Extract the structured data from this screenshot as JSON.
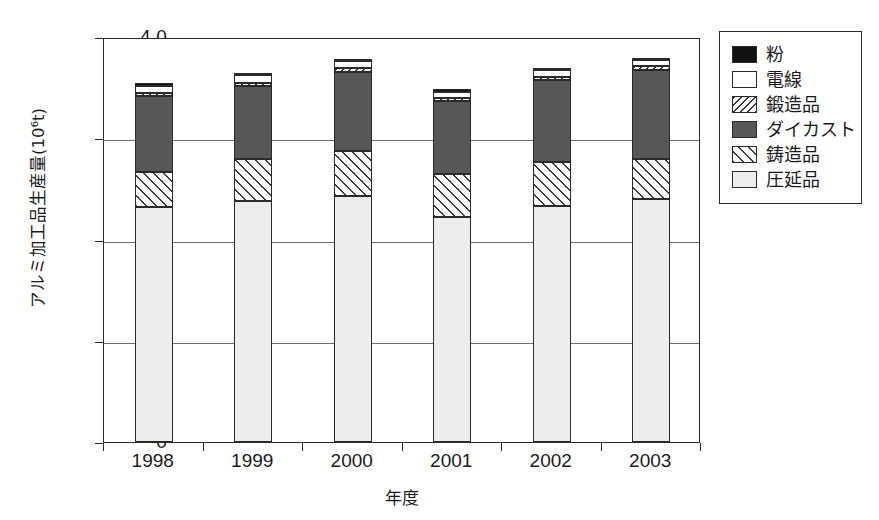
{
  "chart_data": {
    "type": "bar",
    "subtype": "stacked-vertical",
    "title": "",
    "xlabel": "年度",
    "ylabel": "アルミ加工品生産量(10⁶t)",
    "categories": [
      "1998",
      "1999",
      "2000",
      "2001",
      "2002",
      "2003"
    ],
    "ylim": [
      0,
      4.0
    ],
    "ytick_labels": [
      "0",
      "1.0",
      "2.0",
      "3.0",
      "4.0"
    ],
    "ytick_values": [
      0,
      1.0,
      2.0,
      3.0,
      4.0
    ],
    "grid": "horizontal",
    "legend_position": "right-outside",
    "legend_order_top_to_bottom": [
      "粉",
      "電線",
      "鍛造品",
      "ダイカスト",
      "鋳造品",
      "圧延品"
    ],
    "stack_order_bottom_to_top": [
      "圧延品",
      "鋳造品",
      "ダイカスト",
      "鍛造品",
      "電線",
      "粉"
    ],
    "series": [
      {
        "name": "圧延品",
        "pattern": "light-gray-solid",
        "color": "#ededed",
        "values": [
          2.32,
          2.38,
          2.43,
          2.22,
          2.33,
          2.4
        ]
      },
      {
        "name": "鋳造品",
        "pattern": "forward-hatch",
        "color": "#ffffff",
        "values": [
          0.35,
          0.42,
          0.44,
          0.43,
          0.44,
          0.4
        ]
      },
      {
        "name": "ダイカスト",
        "pattern": "dark-gray-solid",
        "color": "#575757",
        "values": [
          0.75,
          0.72,
          0.78,
          0.72,
          0.81,
          0.87
        ]
      },
      {
        "name": "鍛造品",
        "pattern": "backward-hatch",
        "color": "#ffffff",
        "values": [
          0.03,
          0.03,
          0.04,
          0.03,
          0.03,
          0.04
        ]
      },
      {
        "name": "電線",
        "pattern": "white-solid",
        "color": "#ffffff",
        "values": [
          0.07,
          0.07,
          0.07,
          0.06,
          0.06,
          0.06
        ]
      },
      {
        "name": "粉",
        "pattern": "black-solid",
        "color": "#111111",
        "values": [
          0.01,
          0.01,
          0.01,
          0.01,
          0.01,
          0.01
        ]
      }
    ],
    "totals": [
      3.53,
      3.63,
      3.77,
      3.47,
      3.68,
      3.78
    ]
  },
  "legend": {
    "items": [
      {
        "label": "粉",
        "swatch": "black-solid-swatch"
      },
      {
        "label": "電線",
        "swatch": "white-solid-swatch"
      },
      {
        "label": "鍛造品",
        "swatch": "backward-hatch-swatch"
      },
      {
        "label": "ダイカスト",
        "swatch": "dark-gray-solid-swatch"
      },
      {
        "label": "鋳造品",
        "swatch": "forward-hatch-swatch"
      },
      {
        "label": "圧延品",
        "swatch": "light-gray-solid-swatch"
      }
    ]
  }
}
